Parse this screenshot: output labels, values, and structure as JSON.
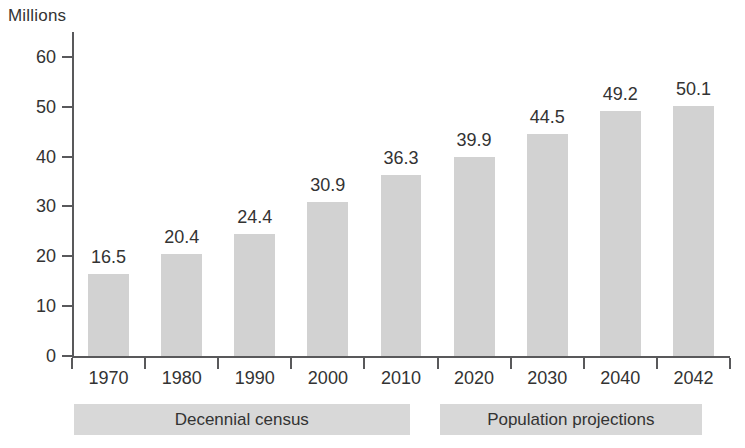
{
  "chart_data": {
    "type": "bar",
    "title": "",
    "subtitle": "",
    "xlabel": "",
    "ylabel": "Millions",
    "ylim": [
      0,
      65
    ],
    "yticks": [
      0,
      10,
      20,
      30,
      40,
      50,
      60
    ],
    "grid": false,
    "legend": "none",
    "categories": [
      "1970",
      "1980",
      "1990",
      "2000",
      "2010",
      "2020",
      "2030",
      "2040",
      "2042"
    ],
    "values": [
      16.5,
      20.4,
      24.4,
      30.9,
      36.3,
      39.9,
      44.5,
      49.2,
      50.1
    ],
    "value_labels": [
      "16.5",
      "20.4",
      "24.4",
      "30.9",
      "36.3",
      "39.9",
      "44.5",
      "49.2",
      "50.1"
    ],
    "groups": [
      {
        "label": "Decennial census",
        "categories": [
          "1970",
          "1980",
          "1990",
          "2000",
          "2010"
        ]
      },
      {
        "label": "Population projections",
        "categories": [
          "2020",
          "2030",
          "2040",
          "2042"
        ]
      }
    ],
    "colors": {
      "bar": "#d2d2d2",
      "band": "#d8d8d8",
      "axis": "#59595b",
      "text": "#333333",
      "background": "#ffffff"
    }
  }
}
